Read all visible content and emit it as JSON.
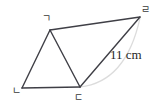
{
  "figure": {
    "background_color": "#ffffff",
    "stroke_color": "#3f3f46",
    "arc_color": "#d8d8d8",
    "label_color": "#3a3a3a",
    "measure_color": "#262626",
    "vertices": [
      {
        "id": "g",
        "label": "ㄱ",
        "x": 50,
        "y": 30
      },
      {
        "id": "n",
        "label": "ㄴ",
        "x": 22,
        "y": 88
      },
      {
        "id": "d",
        "label": "ㄷ",
        "x": 80,
        "y": 87
      },
      {
        "id": "r",
        "label": "ㄹ",
        "x": 140,
        "y": 17
      }
    ],
    "edges": [
      {
        "id": "edge-g-r",
        "from": "g",
        "to": "r",
        "style": "solid"
      },
      {
        "id": "edge-g-n",
        "from": "g",
        "to": "n",
        "style": "solid"
      },
      {
        "id": "edge-n-d",
        "from": "n",
        "to": "d",
        "style": "solid"
      },
      {
        "id": "edge-g-d",
        "from": "g",
        "to": "d",
        "style": "solid"
      },
      {
        "id": "edge-d-r",
        "from": "d",
        "to": "r",
        "style": "solid"
      }
    ],
    "arc": {
      "id": "arc-d-r",
      "from": "d",
      "to": "r",
      "style": "faint-curve",
      "bulge": "right"
    },
    "measurement": {
      "label": "11 cm",
      "applies_to": "edge-d-r"
    }
  }
}
